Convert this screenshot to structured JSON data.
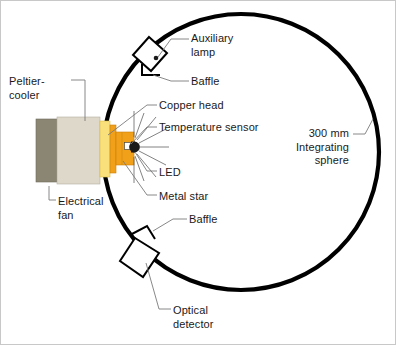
{
  "figure": {
    "background_color": "#ffffff",
    "border_color": "#c8c8c8"
  },
  "labels": {
    "peltier_cooler": "Peltier-\ncooler",
    "electrical_fan": "Electrical\nfan",
    "auxiliary_lamp": "Auxiliary\nlamp",
    "baffle_top": "Baffle",
    "copper_head": "Copper head",
    "temperature_sensor": "Temperature sensor",
    "led": "LED",
    "metal_star": "Metal star",
    "integrating_sphere": "300 mm\nIntegrating\nsphere",
    "baffle_bottom": "Baffle",
    "optical_detector": "Optical\ndetector"
  },
  "colors": {
    "sphere_wall": "#000000",
    "fan_body": "#8a8673",
    "peltier_body": "#ddd8c9",
    "copper_head_plate": "#f9e07a",
    "metal_star": "#f0a019",
    "metal_star_dark": "#e08c10",
    "led_dome": "#1a1a1a",
    "temperature_sensor": "#ffffff",
    "leader_line": "#6b6b6b",
    "label_text": "#1a1a1a",
    "component_outline": "#000000"
  },
  "geometry": {
    "sphere_center_x": 240,
    "sphere_center_y": 151,
    "sphere_radius": 138,
    "sphere_stroke_width": 4,
    "sphere_diameter_mm": 300
  }
}
